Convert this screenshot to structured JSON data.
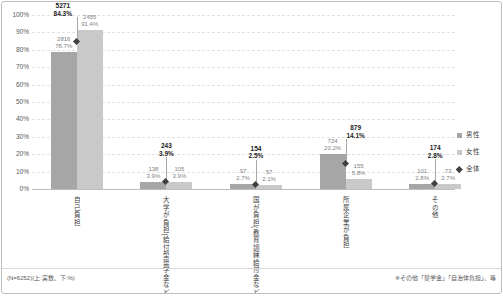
{
  "frame": {
    "footnote_left": "(N=6252)(上:実数、下:%)",
    "footnote_right": "※その他「奨学金」「自治体負担」、等"
  },
  "legend": {
    "position": "right",
    "items": [
      {
        "label": "男性",
        "marker": "square",
        "color": "#a6a6a6"
      },
      {
        "label": "女性",
        "marker": "square",
        "color": "#c9c9c9"
      },
      {
        "label": "全体",
        "marker": "diamond",
        "color": "#404040"
      }
    ]
  },
  "chart_data": {
    "type": "bar",
    "title": "",
    "xlabel": "",
    "ylabel": "",
    "ylim": [
      0,
      100
    ],
    "grid": true,
    "legend_position": "right",
    "n": 6252,
    "value_label_format": "上:実数 / 下:%",
    "yticks": [
      "0%",
      "10%",
      "20%",
      "30%",
      "40%",
      "50%",
      "60%",
      "70%",
      "80%",
      "90%",
      "100%"
    ],
    "categories": [
      "自己負担",
      "大学が負担(給付型奨学金など)",
      "国が負担(教育訓練給付金など)",
      "所属企業が負担",
      "その他"
    ],
    "series": [
      {
        "name": "男性",
        "type": "bar",
        "color": "#a6a6a6",
        "counts": [
          2816,
          138,
          97,
          724,
          101
        ],
        "percents": [
          78.7,
          3.9,
          2.7,
          20.2,
          2.8
        ]
      },
      {
        "name": "女性",
        "type": "bar",
        "color": "#c9c9c9",
        "counts": [
          2455,
          105,
          57,
          155,
          73
        ],
        "percents": [
          91.4,
          3.9,
          2.1,
          5.8,
          2.7
        ]
      },
      {
        "name": "全体",
        "type": "scatter-diamond",
        "color": "#404040",
        "counts": [
          5271,
          243,
          154,
          879,
          174
        ],
        "percents": [
          84.3,
          3.9,
          2.5,
          14.1,
          2.8
        ]
      }
    ]
  }
}
